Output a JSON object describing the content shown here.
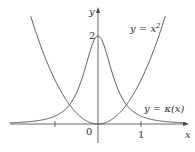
{
  "chart_data": {
    "type": "line",
    "title": "",
    "xlabel": "x",
    "ylabel": "y",
    "x_ticks": [
      "0",
      "1"
    ],
    "y_ticks": [
      "2"
    ],
    "series": [
      {
        "name": "y = x^2",
        "label": "y = x²",
        "function": "x^2"
      },
      {
        "name": "y = κ(x)",
        "label": "y = κ(x)",
        "function": "2/(1+4x^2)^(3/2)",
        "peak": [
          0,
          2
        ]
      }
    ],
    "xlim": [
      -2.3,
      2.2
    ],
    "ylim": [
      -0.5,
      2.8
    ],
    "grid": false
  },
  "labels": {
    "y_axis": "y",
    "x_axis": "x",
    "origin": "0",
    "x_tick_one": "1",
    "y_tick_two": "2",
    "curve_parabola": "y = x",
    "curve_parabola_exp": "2",
    "curve_curvature": "y = κ(x)"
  }
}
